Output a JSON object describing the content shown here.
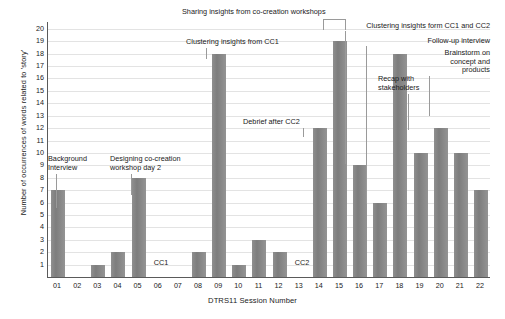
{
  "chart_data": {
    "type": "bar",
    "title": "",
    "xlabel": "DTRS11 Session Number",
    "ylabel": "Number of occurrences of words related to 'story'",
    "categories": [
      "01",
      "02",
      "03",
      "04",
      "05",
      "06",
      "07",
      "08",
      "09",
      "10",
      "11",
      "12",
      "13",
      "14",
      "15",
      "16",
      "17",
      "18",
      "19",
      "20",
      "21",
      "22"
    ],
    "values": [
      7,
      0,
      1,
      2,
      8,
      0,
      0,
      2,
      18,
      1,
      3,
      2,
      0,
      12,
      19,
      9,
      6,
      18,
      10,
      12,
      10,
      7
    ],
    "ylim": [
      0,
      20
    ],
    "yticks": [
      1,
      2,
      3,
      4,
      5,
      6,
      7,
      8,
      9,
      10,
      11,
      12,
      13,
      14,
      15,
      16,
      17,
      18,
      19,
      20
    ],
    "grid": true,
    "legend": "none",
    "bar_color": "#858585",
    "grid_color": "#e3e3e3",
    "axis_color": "#5a5a5a",
    "inline_notes": [
      {
        "text": "CC1",
        "category": "06"
      },
      {
        "text": "CC2",
        "category": "13"
      }
    ],
    "annotations": [
      {
        "text": "Background\nInterview",
        "category": "01",
        "value": 7
      },
      {
        "text": "Designing co-creation\nworkshop day 2",
        "category": "05",
        "value": 8
      },
      {
        "text": "Clustering insights from CC1",
        "category": "09",
        "value": 18
      },
      {
        "text": "Debrief after CC2",
        "category": "14",
        "value": 12
      },
      {
        "text": "Sharing insights from co-creation workshops",
        "category": "15",
        "value": 19
      },
      {
        "text": "Clustering insights form CC1 and CC2",
        "category": "16",
        "value": 9
      },
      {
        "text": "Follow-up interview",
        "category": "17",
        "value": 6
      },
      {
        "text": "Brainstorm on\nconcept and\nproducts",
        "category": "18",
        "value": 18
      },
      {
        "text": "Recap with\nstakeholders",
        "category": "19",
        "value": 10
      }
    ]
  },
  "axis": {
    "ylabel": "Number of occurrences of words related to 'story'",
    "xlabel": "DTRS11 Session Number",
    "ytick_20": "20",
    "ytick_19": "19",
    "ytick_18": "18",
    "ytick_17": "17",
    "ytick_16": "16",
    "ytick_15": "15",
    "ytick_14": "14",
    "ytick_13": "13",
    "ytick_12": "12",
    "ytick_11": "11",
    "ytick_10": "10",
    "ytick_9": "9",
    "ytick_8": "8",
    "ytick_7": "7",
    "ytick_6": "6",
    "ytick_5": "5",
    "ytick_4": "4",
    "ytick_3": "3",
    "ytick_2": "2",
    "ytick_1": "1"
  },
  "annotations": {
    "background_interview": "Background\nInterview",
    "designing_workshop": "Designing co-creation\nworkshop day 2",
    "clustering_cc1": "Clustering insights from CC1",
    "debrief_cc2": "Debrief after CC2",
    "sharing_insights": "Sharing insights from co-creation workshops",
    "clustering_cc1_cc2": "Clustering insights form CC1 and CC2",
    "followup_interview": "Follow-up interview",
    "brainstorm": "Brainstorm on\nconcept and\nproducts",
    "recap": "Recap with\nstakeholders",
    "cc1": "CC1",
    "cc2": "CC2"
  }
}
